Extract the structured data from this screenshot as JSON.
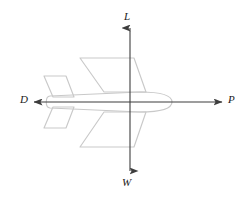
{
  "figure": {
    "background_color": "#ffffff",
    "axis_color": "#3d3d3d",
    "aircraft_outline_color": "#c9c9c9",
    "label_color": "#1a1a1a"
  },
  "forces": {
    "lift": {
      "symbol": "L",
      "name": "lift",
      "direction": "up",
      "arrow_name": "lift-arrow",
      "tail": {
        "x": 130,
        "y": 102
      },
      "head": {
        "x": 130,
        "y": 28
      }
    },
    "weight": {
      "symbol": "W",
      "name": "weight",
      "direction": "down",
      "arrow_name": "weight-arrow",
      "tail": {
        "x": 130,
        "y": 102
      },
      "head": {
        "x": 130,
        "y": 171
      }
    },
    "drag": {
      "symbol": "D",
      "name": "drag",
      "direction": "left",
      "arrow_name": "drag-arrow",
      "tail": {
        "x": 130,
        "y": 102
      },
      "head": {
        "x": 34,
        "y": 102
      }
    },
    "thrust": {
      "symbol": "P",
      "name": "thrust",
      "direction": "right",
      "arrow_name": "thrust-arrow",
      "tail": {
        "x": 130,
        "y": 102
      },
      "head": {
        "x": 222,
        "y": 102
      }
    }
  },
  "aircraft": {
    "name": "airplane-top-view",
    "heading": "right",
    "center": {
      "x": 130,
      "y": 102
    }
  }
}
